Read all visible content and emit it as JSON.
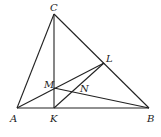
{
  "figure": {
    "type": "geometry-diagram",
    "line_color": "#222222",
    "background": "#ffffff",
    "points": {
      "A": {
        "label": "A",
        "x": 17,
        "y": 108
      },
      "B": {
        "label": "B",
        "x": 149,
        "y": 108
      },
      "C": {
        "label": "C",
        "x": 54,
        "y": 14
      },
      "K": {
        "label": "K",
        "x": 54,
        "y": 108
      },
      "M": {
        "label": "M",
        "x": 54,
        "y": 88
      },
      "L": {
        "label": "L",
        "x": 104,
        "y": 63
      },
      "N": {
        "label": "N",
        "x": 72,
        "y": 92
      }
    },
    "segments": [
      [
        "A",
        "B"
      ],
      [
        "B",
        "C"
      ],
      [
        "C",
        "A"
      ],
      [
        "C",
        "K"
      ],
      [
        "A",
        "L"
      ],
      [
        "M",
        "B"
      ],
      [
        "K",
        "L"
      ]
    ]
  }
}
